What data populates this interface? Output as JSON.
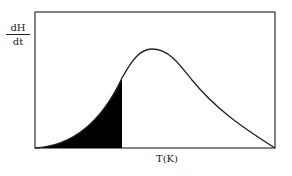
{
  "diagram": {
    "y_axis_label": {
      "numerator": "dH",
      "denominator": "dt"
    },
    "x_axis_label": "T(K)",
    "curve": "asymmetric peak (DSC heating curve)",
    "shaded_region": "area under curve from start to partial temperature",
    "colors": {
      "line": "#222222",
      "fill": "#000000",
      "background": "#ffffff"
    }
  }
}
